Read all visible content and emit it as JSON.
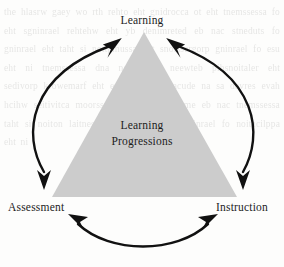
{
  "figure": {
    "center_label_line1": "Learning",
    "center_label_line2": "Progressions",
    "vertices": [
      {
        "id": "learning",
        "label": "Learning",
        "position": "top"
      },
      {
        "id": "assessment",
        "label": "Assessment",
        "position": "bottom-left"
      },
      {
        "id": "instruction",
        "label": "Instruction",
        "position": "bottom-right"
      }
    ],
    "arrows": [
      {
        "id": "arc-left",
        "from": "Assessment",
        "to": "Learning",
        "style": "double-headed curved arrow",
        "side": "left"
      },
      {
        "id": "arc-right",
        "from": "Learning",
        "to": "Instruction",
        "style": "double-headed curved arrow",
        "side": "right"
      },
      {
        "id": "arc-bottom",
        "from": "Assessment",
        "to": "Instruction",
        "style": "double-headed curved arrow",
        "side": "bottom"
      }
    ],
    "colors": {
      "triangle_fill": "#cccccc",
      "arrow_stroke": "#111111",
      "text": "#1c1c1c",
      "background": "#fdfdfc"
    },
    "background_bleed_text": "the hlasrw gaey wo rth rehto eht gnidrocca ot eht tnemssessa fo eht sgninrael rehtehw eht yb denimreted eb nac stneduts fo gninrael eht taht si noitpmussa eht snoissergorp gninrael fo esu eht ni tnemssessa dna noitcurtsni neewteb pihsnoitaler eht sedivorp krowemarf eht erutcurts lanoitacude na sa devres evah hcihw seitivitca moorssalc yliad ni dedebme eb nac tnemssessa taht si noiton laitnesse eht snoissergorp gninrael fo noitacilppa eht ni"
  }
}
